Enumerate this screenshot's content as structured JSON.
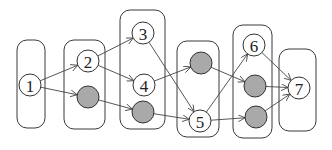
{
  "diagram": {
    "type": "layered-directed-graph",
    "colors": {
      "background": "#ffffff",
      "stroke": "#333333",
      "gray_fill": "#a9a9a9",
      "white_fill": "#ffffff"
    },
    "groups": [
      {
        "id": "g1",
        "x": 17,
        "y": 40,
        "w": 28,
        "h": 88
      },
      {
        "id": "g2",
        "x": 64,
        "y": 40,
        "w": 41,
        "h": 89
      },
      {
        "id": "g3",
        "x": 120,
        "y": 10,
        "w": 45,
        "h": 119
      },
      {
        "id": "g4",
        "x": 177,
        "y": 41,
        "w": 42,
        "h": 96
      },
      {
        "id": "g5",
        "x": 233,
        "y": 25,
        "w": 39,
        "h": 113
      },
      {
        "id": "g6",
        "x": 279,
        "y": 49,
        "w": 37,
        "h": 82
      }
    ],
    "nodes": [
      {
        "id": "n1",
        "label": "1",
        "cx": 30,
        "cy": 85,
        "fill": "white"
      },
      {
        "id": "n2",
        "label": "2",
        "cx": 88,
        "cy": 61,
        "fill": "white"
      },
      {
        "id": "gA",
        "label": "",
        "cx": 88,
        "cy": 97,
        "fill": "gray"
      },
      {
        "id": "n3",
        "label": "3",
        "cx": 143,
        "cy": 33,
        "fill": "white"
      },
      {
        "id": "n4",
        "label": "4",
        "cx": 144,
        "cy": 85,
        "fill": "white"
      },
      {
        "id": "gB",
        "label": "",
        "cx": 143,
        "cy": 112,
        "fill": "gray"
      },
      {
        "id": "gC",
        "label": "",
        "cx": 201,
        "cy": 63,
        "fill": "gray"
      },
      {
        "id": "n5",
        "label": "5",
        "cx": 200,
        "cy": 121,
        "fill": "white"
      },
      {
        "id": "n6",
        "label": "6",
        "cx": 254,
        "cy": 45,
        "fill": "white"
      },
      {
        "id": "gD",
        "label": "",
        "cx": 255,
        "cy": 86,
        "fill": "gray"
      },
      {
        "id": "gE",
        "label": "",
        "cx": 256,
        "cy": 117,
        "fill": "gray"
      },
      {
        "id": "n7",
        "label": "7",
        "cx": 299,
        "cy": 88,
        "fill": "white"
      }
    ],
    "edges": [
      {
        "from": "n1",
        "to": "n2"
      },
      {
        "from": "n1",
        "to": "gA"
      },
      {
        "from": "n2",
        "to": "n3"
      },
      {
        "from": "n2",
        "to": "n4"
      },
      {
        "from": "gA",
        "to": "gB"
      },
      {
        "from": "n3",
        "to": "n5"
      },
      {
        "from": "n4",
        "to": "gC"
      },
      {
        "from": "gB",
        "to": "n5"
      },
      {
        "from": "gC",
        "to": "gD"
      },
      {
        "from": "n5",
        "to": "n6"
      },
      {
        "from": "n5",
        "to": "gE"
      },
      {
        "from": "n6",
        "to": "n7"
      },
      {
        "from": "gD",
        "to": "n7"
      },
      {
        "from": "gE",
        "to": "n7"
      }
    ]
  }
}
